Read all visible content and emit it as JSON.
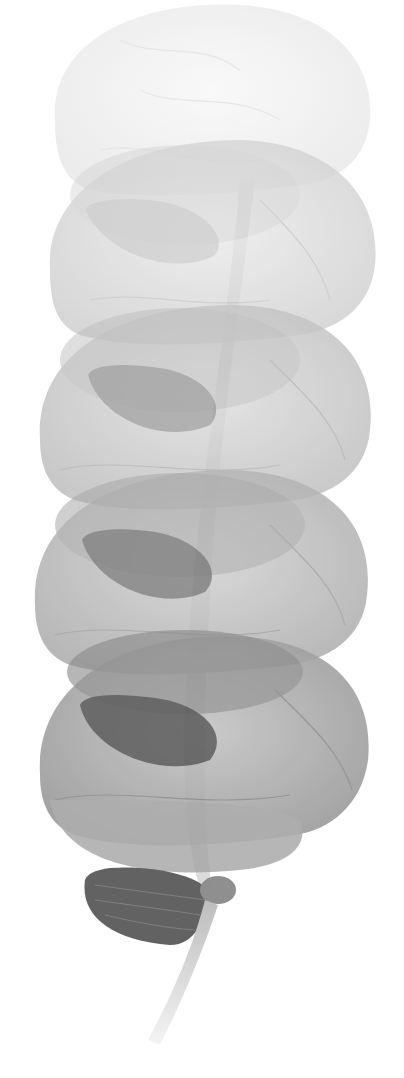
{
  "image": {
    "subject": "Stacked translucent brain illustrations",
    "background": "#ffffff",
    "layers": [
      {
        "name": "brain-layer-1",
        "cy": 95,
        "shade": "#f1f1f1",
        "inner": "#e9e9e9",
        "opacity": 0.7
      },
      {
        "name": "brain-layer-2",
        "cy": 250,
        "shade": "#dedede",
        "inner": "#c9c9c9",
        "opacity": 0.75
      },
      {
        "name": "brain-layer-3",
        "cy": 415,
        "shade": "#cfcfcf",
        "inner": "#a9a9a9",
        "opacity": 0.78
      },
      {
        "name": "brain-layer-4",
        "cy": 580,
        "shade": "#c2c2c2",
        "inner": "#8f8f8f",
        "opacity": 0.8
      },
      {
        "name": "brain-layer-5",
        "cy": 745,
        "shade": "#adadad",
        "inner": "#6e6e6e",
        "opacity": 0.85
      }
    ],
    "cerebellum_color": "#555555",
    "spinal_cord_color": "#cfcfcf"
  }
}
